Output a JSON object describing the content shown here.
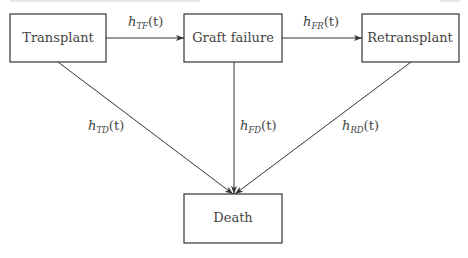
{
  "diagram": {
    "nodes": [
      {
        "id": "transplant",
        "label": "Transplant"
      },
      {
        "id": "graft_failure",
        "label": "Graft failure"
      },
      {
        "id": "retransplant",
        "label": "Retransplant"
      },
      {
        "id": "death",
        "label": "Death"
      }
    ],
    "edges": [
      {
        "from": "transplant",
        "to": "graft_failure",
        "label_base": "h",
        "label_sub": "TF",
        "label_arg": "(t)"
      },
      {
        "from": "graft_failure",
        "to": "retransplant",
        "label_base": "h",
        "label_sub": "FR",
        "label_arg": "(t)"
      },
      {
        "from": "transplant",
        "to": "death",
        "label_base": "h",
        "label_sub": "TD",
        "label_arg": "(t)"
      },
      {
        "from": "graft_failure",
        "to": "death",
        "label_base": "h",
        "label_sub": "FD",
        "label_arg": "(t)"
      },
      {
        "from": "retransplant",
        "to": "death",
        "label_base": "h",
        "label_sub": "RD",
        "label_arg": "(t)"
      }
    ]
  }
}
